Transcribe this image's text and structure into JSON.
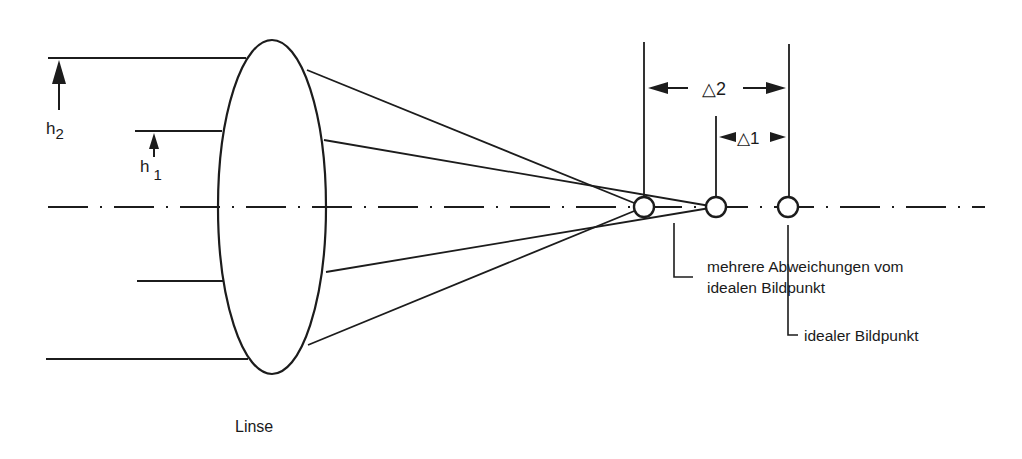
{
  "diagram": {
    "type": "optical-spherical-aberration",
    "labels": {
      "h2": "h",
      "h2_sub": "2",
      "h1": "h",
      "h1_sub": "1",
      "delta2": "△2",
      "delta1": "△1",
      "deviations_line1": "mehrere Abweichungen vom",
      "deviations_line2": "idealen Bildpunkt",
      "ideal_point": "idealer Bildpunkt",
      "lens": "Linse"
    },
    "colors": {
      "ink": "#1c1c1c",
      "background": "#ffffff"
    }
  }
}
